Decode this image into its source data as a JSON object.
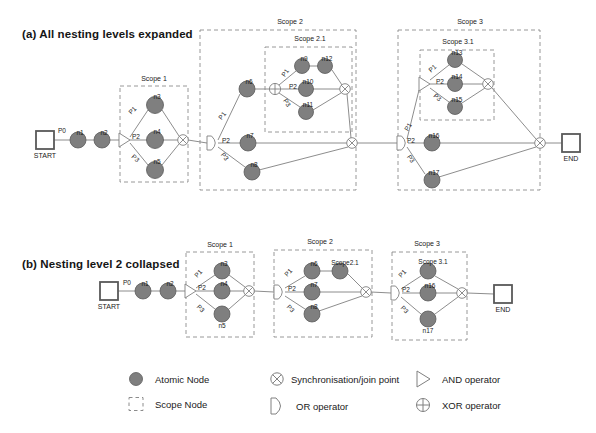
{
  "figure": {
    "panels": [
      {
        "id": "a",
        "title": "(a) All nesting levels expanded"
      },
      {
        "id": "b",
        "title": "(b) Nesting level 2 collapsed"
      }
    ]
  },
  "colors": {
    "atomic_node_fill": "#7f7f7f",
    "atomic_node_stroke": "#5a5a5a",
    "edge": "#808080",
    "scope_border": "#8c8c8c",
    "terminal_stroke": "#595959",
    "text": "#1a1a1a",
    "background": "#ffffff"
  },
  "panel_a": {
    "terminals": [
      {
        "name": "start",
        "label": "START",
        "x": 45,
        "y": 140
      },
      {
        "name": "end",
        "label": "END",
        "x": 571,
        "y": 143
      }
    ],
    "edge_labels": [
      {
        "text": "P0",
        "x": 62,
        "y": 133
      },
      {
        "text": "P1",
        "x": 134,
        "y": 112,
        "rot": -45
      },
      {
        "text": "P2",
        "x": 136,
        "y": 139
      },
      {
        "text": "P3",
        "x": 134,
        "y": 160,
        "rot": 42
      },
      {
        "text": "P1",
        "x": 224,
        "y": 117,
        "rot": -52
      },
      {
        "text": "P2",
        "x": 226,
        "y": 143
      },
      {
        "text": "P3",
        "x": 223,
        "y": 158,
        "rot": 52
      },
      {
        "text": "P1",
        "x": 287,
        "y": 74,
        "rot": -55
      },
      {
        "text": "P2",
        "x": 293,
        "y": 89
      },
      {
        "text": "P3",
        "x": 285,
        "y": 104,
        "rot": 58
      },
      {
        "text": "P1",
        "x": 410,
        "y": 128,
        "rot": -60
      },
      {
        "text": "P2",
        "x": 411,
        "y": 143
      },
      {
        "text": "P3",
        "x": 409,
        "y": 160,
        "rot": 57
      },
      {
        "text": "P1",
        "x": 434,
        "y": 70,
        "rot": -42
      },
      {
        "text": "P2",
        "x": 440,
        "y": 84
      },
      {
        "text": "P3",
        "x": 436,
        "y": 99,
        "rot": 40
      }
    ],
    "scopes": [
      {
        "name": "scope-1",
        "label": "Scope 1",
        "x": 120,
        "y": 86,
        "w": 68,
        "h": 96,
        "label_x": 154,
        "label_y": 81
      },
      {
        "name": "scope-2",
        "label": "Scope 2",
        "x": 200,
        "y": 30,
        "w": 156,
        "h": 160,
        "label_x": 290,
        "label_y": 24
      },
      {
        "name": "scope-2-1",
        "label": "Scope 2.1",
        "x": 265,
        "y": 47,
        "w": 87,
        "h": 85,
        "label_x": 310,
        "label_y": 41
      },
      {
        "name": "scope-3",
        "label": "Scope 3",
        "x": 398,
        "y": 30,
        "w": 142,
        "h": 160,
        "label_x": 470,
        "label_y": 24
      },
      {
        "name": "scope-3-1",
        "label": "Scope 3.1",
        "x": 420,
        "y": 50,
        "w": 74,
        "h": 70,
        "label_x": 458,
        "label_y": 44
      }
    ],
    "atomic_nodes": [
      {
        "label": "n1",
        "x": 78,
        "y": 140,
        "r": 8
      },
      {
        "label": "n2",
        "x": 102,
        "y": 140,
        "r": 8
      },
      {
        "label": "n3",
        "x": 155,
        "y": 105,
        "r": 8.5
      },
      {
        "label": "n4",
        "x": 155,
        "y": 140,
        "r": 8.5
      },
      {
        "label": "n5",
        "x": 155,
        "y": 170,
        "r": 8.5
      },
      {
        "label": "n6",
        "x": 247,
        "y": 89,
        "r": 8
      },
      {
        "label": "n7",
        "x": 248,
        "y": 143,
        "r": 8
      },
      {
        "label": "n8",
        "x": 252,
        "y": 172,
        "r": 8
      },
      {
        "label": "n9",
        "x": 302,
        "y": 66,
        "r": 7.5
      },
      {
        "label": "n10",
        "x": 306,
        "y": 89,
        "r": 7.5
      },
      {
        "label": "n11",
        "x": 306,
        "y": 112,
        "r": 7.5
      },
      {
        "label": "n12",
        "x": 325,
        "y": 66,
        "r": 7.5
      },
      {
        "label": "n13",
        "x": 455,
        "y": 60,
        "r": 7.5
      },
      {
        "label": "n14",
        "x": 455,
        "y": 84,
        "r": 7.5
      },
      {
        "label": "n15",
        "x": 455,
        "y": 107,
        "r": 7.5
      },
      {
        "label": "n16",
        "x": 432,
        "y": 143,
        "r": 8
      },
      {
        "label": "n17",
        "x": 432,
        "y": 180,
        "r": 8
      }
    ],
    "operators": [
      {
        "name": "and-operator-scope1",
        "type": "AND",
        "x": 124,
        "y": 140
      },
      {
        "name": "or-operator-scope2",
        "type": "OR",
        "x": 212,
        "y": 143
      },
      {
        "name": "xor-operator-scope2-1",
        "type": "XOR",
        "x": 275,
        "y": 89
      },
      {
        "name": "or-operator-scope3",
        "type": "OR",
        "x": 402,
        "y": 143
      },
      {
        "name": "and-operator-scope3-1",
        "type": "AND",
        "x": 424,
        "y": 84
      }
    ],
    "joins": [
      {
        "name": "join-scope1",
        "x": 183,
        "y": 140
      },
      {
        "name": "join-scope2-1",
        "x": 345,
        "y": 89
      },
      {
        "name": "join-scope2",
        "x": 352,
        "y": 143
      },
      {
        "name": "join-scope3-1",
        "x": 488,
        "y": 84
      },
      {
        "name": "join-scope3",
        "x": 540,
        "y": 143
      }
    ]
  },
  "panel_b": {
    "terminals": [
      {
        "name": "start",
        "label": "START",
        "x": 109,
        "y": 291
      },
      {
        "name": "end",
        "label": "END",
        "x": 503,
        "y": 294
      }
    ],
    "edge_labels": [
      {
        "text": "P0",
        "x": 127,
        "y": 285
      },
      {
        "text": "P1",
        "x": 200,
        "y": 275,
        "rot": -47
      },
      {
        "text": "P2",
        "x": 202,
        "y": 290
      },
      {
        "text": "P3",
        "x": 199,
        "y": 310,
        "rot": 45
      },
      {
        "text": "P1",
        "x": 290,
        "y": 274,
        "rot": -47
      },
      {
        "text": "P2",
        "x": 292,
        "y": 291
      },
      {
        "text": "P3",
        "x": 289,
        "y": 310,
        "rot": 46
      },
      {
        "text": "P1",
        "x": 404,
        "y": 275,
        "rot": -47
      },
      {
        "text": "P2",
        "x": 406,
        "y": 292
      },
      {
        "text": "P3",
        "x": 403,
        "y": 311,
        "rot": 46
      }
    ],
    "scopes": [
      {
        "name": "scope-1",
        "label": "Scope 1",
        "x": 186,
        "y": 252,
        "w": 68,
        "h": 85,
        "label_x": 220,
        "label_y": 247
      },
      {
        "name": "scope-2",
        "label": "Scope 2",
        "x": 274,
        "y": 250,
        "w": 98,
        "h": 87,
        "label_x": 320,
        "label_y": 244
      },
      {
        "name": "scope-3",
        "label": "Scope 3",
        "x": 392,
        "y": 252,
        "w": 75,
        "h": 88,
        "label_x": 427,
        "label_y": 246
      }
    ],
    "atomic_nodes": [
      {
        "label": "n1",
        "x": 143,
        "y": 291,
        "r": 8
      },
      {
        "label": "n2",
        "x": 168,
        "y": 291,
        "r": 8
      },
      {
        "label": "n3",
        "x": 222,
        "y": 271,
        "r": 8
      },
      {
        "label": "n4",
        "x": 222,
        "y": 291,
        "r": 8
      },
      {
        "label": "n5",
        "x": 222,
        "y": 314,
        "r": 8
      },
      {
        "label": "n6",
        "x": 312,
        "y": 271,
        "r": 8
      },
      {
        "label": "n7",
        "x": 312,
        "y": 292,
        "r": 8
      },
      {
        "label": "n8",
        "x": 312,
        "y": 314,
        "r": 8
      },
      {
        "label": "n16",
        "x": 428,
        "y": 293,
        "r": 8
      },
      {
        "label": "n17",
        "x": 428,
        "y": 319,
        "r": 8
      }
    ],
    "scope_nodes_collapsed": [
      {
        "label": "Scope2.1",
        "x": 340,
        "y": 271,
        "r": 8,
        "label_x": 345,
        "label_y": 265
      },
      {
        "label": "Scope 3.1",
        "x": 428,
        "y": 271,
        "r": 8,
        "label_x": 433,
        "label_y": 264
      }
    ],
    "operators": [
      {
        "name": "and-operator-scope1",
        "type": "AND",
        "x": 190,
        "y": 291
      },
      {
        "name": "or-operator-scope2",
        "type": "OR",
        "x": 279,
        "y": 292
      },
      {
        "name": "or-operator-scope3",
        "type": "OR",
        "x": 396,
        "y": 293
      }
    ],
    "joins": [
      {
        "name": "join-scope1",
        "x": 249,
        "y": 291
      },
      {
        "name": "join-scope2",
        "x": 366,
        "y": 292
      },
      {
        "name": "join-scope3",
        "x": 462,
        "y": 293
      }
    ]
  },
  "legend": {
    "items": [
      {
        "name": "legend-atomic-node",
        "symbol": "atomic-node-icon",
        "label": "Atomic Node",
        "sx": 136,
        "sy": 379,
        "tx": 155,
        "ty": 383
      },
      {
        "name": "legend-scope-node",
        "symbol": "scope-node-icon",
        "label": "Scope Node",
        "sx": 136,
        "sy": 404,
        "tx": 155,
        "ty": 408
      },
      {
        "name": "legend-sync-join",
        "symbol": "sync-join-icon",
        "label": "Synchronisation/join point",
        "sx": 277,
        "sy": 379,
        "tx": 291,
        "ty": 383
      },
      {
        "name": "legend-or-operator",
        "symbol": "or-operator-icon",
        "label": "OR operator",
        "sx": 277,
        "sy": 406,
        "tx": 296,
        "ty": 410
      },
      {
        "name": "legend-and-operator",
        "symbol": "and-operator-icon",
        "label": "AND operator",
        "sx": 423,
        "sy": 379,
        "tx": 442,
        "ty": 383
      },
      {
        "name": "legend-xor-operator",
        "symbol": "xor-operator-icon",
        "label": "XOR  operator",
        "sx": 423,
        "sy": 405,
        "tx": 442,
        "ty": 409
      }
    ]
  }
}
